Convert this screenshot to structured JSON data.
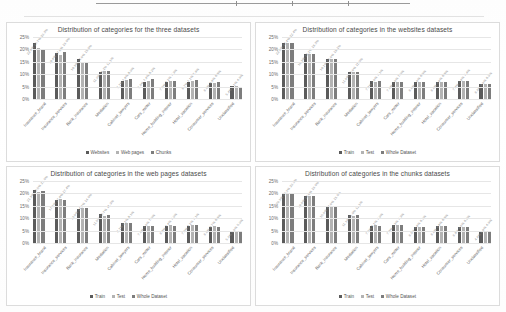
{
  "page": {
    "background_color": "#ffffff",
    "rule_color": "#9a9a9a"
  },
  "colors": {
    "series_1": "#5b5b5b",
    "series_2": "#b3b3b3",
    "series_3": "#7d7d7d",
    "gridline": "#e6e6e6",
    "title_text": "#4a4a4a",
    "tick_text": "#6b6b6b"
  },
  "categories": [
    "Insurance_brand",
    "Insurance_services",
    "Bank_insurance",
    "Mediation",
    "Cabinet_lawyers",
    "Cars_motor",
    "Home_building_interior",
    "Hotel_vacation",
    "Consumer_services",
    "Unclassified"
  ],
  "axis": {
    "y_ticks": [
      "0%",
      "5%",
      "10%",
      "15%",
      "20%",
      "25%"
    ],
    "y_min": 0,
    "y_max": 25
  },
  "charts": [
    {
      "id": "three-datasets",
      "title": "Distribution of categories for the three datasets",
      "legend": [
        "Websites",
        "Web pages",
        "Chunks"
      ]
    },
    {
      "id": "websites-datasets",
      "title": "Distribution of categories in the websites datasets",
      "legend": [
        "Train",
        "Test",
        "Whole Dataset"
      ]
    },
    {
      "id": "web-pages-datasets",
      "title": "Distribution of categories in the web pages datasets",
      "legend": [
        "Train",
        "Test",
        "Whole Dataset"
      ]
    },
    {
      "id": "chunks-datasets",
      "title": "Distribution of categories in the chunks datasets",
      "legend": [
        "Train",
        "Test",
        "Whole Dataset"
      ]
    }
  ],
  "chart_data": [
    {
      "type": "bar",
      "title": "Distribution of categories for the three datasets",
      "xlabel": "",
      "ylabel": "",
      "ylim": [
        0,
        25
      ],
      "grid": true,
      "legend_position": "bottom",
      "categories": [
        "Insurance_brand",
        "Insurance_services",
        "Bank_insurance",
        "Mediation",
        "Cabinet_lawyers",
        "Cars_motor",
        "Home_building_interior",
        "Hotel_vacation",
        "Consumer_services",
        "Unclassified"
      ],
      "series": [
        {
          "name": "Websites",
          "values": [
            22.4,
            18.4,
            16.3,
            11.0,
            7.1,
            7.0,
            7.0,
            6.7,
            6.6,
            5.4
          ]
        },
        {
          "name": "Web pages",
          "values": [
            20.7,
            17.8,
            14.9,
            11.1,
            7.6,
            7.4,
            7.2,
            7.1,
            6.6,
            5.1
          ]
        },
        {
          "name": "Chunks",
          "values": [
            20.3,
            19.0,
            15.0,
            11.1,
            8.0,
            8.2,
            7.3,
            7.6,
            6.8,
            4.9
          ]
        }
      ]
    },
    {
      "type": "bar",
      "title": "Distribution of categories in the websites datasets",
      "xlabel": "",
      "ylabel": "",
      "ylim": [
        0,
        25
      ],
      "grid": true,
      "legend_position": "bottom",
      "categories": [
        "Insurance_brand",
        "Insurance_services",
        "Bank_insurance",
        "Mediation",
        "Cabinet_lawyers",
        "Cars_motor",
        "Home_building_interior",
        "Hotel_vacation",
        "Consumer_services",
        "Unclassified"
      ],
      "series": [
        {
          "name": "Train",
          "values": [
            22.5,
            18.3,
            16.1,
            11.0,
            7.1,
            7.0,
            6.9,
            6.8,
            7.4,
            6.0
          ]
        },
        {
          "name": "Test",
          "values": [
            22.4,
            18.2,
            16.0,
            10.9,
            7.0,
            7.0,
            7.0,
            6.9,
            7.4,
            6.0
          ]
        },
        {
          "name": "Whole Dataset",
          "values": [
            22.4,
            18.3,
            16.1,
            11.0,
            7.1,
            7.0,
            6.9,
            6.8,
            7.4,
            6.0
          ]
        }
      ]
    },
    {
      "type": "bar",
      "title": "Distribution of categories in the web pages datasets",
      "xlabel": "",
      "ylabel": "",
      "ylim": [
        0,
        25
      ],
      "grid": true,
      "legend_position": "bottom",
      "categories": [
        "Insurance_brand",
        "Insurance_services",
        "Bank_insurance",
        "Mediation",
        "Cabinet_lawyers",
        "Cars_motor",
        "Home_building_interior",
        "Hotel_vacation",
        "Consumer_services",
        "Unclassified"
      ],
      "series": [
        {
          "name": "Train",
          "values": [
            21.3,
            17.2,
            13.9,
            11.5,
            8.1,
            7.0,
            6.8,
            7.0,
            6.6,
            5.0
          ]
        },
        {
          "name": "Test",
          "values": [
            20.5,
            17.6,
            14.2,
            10.7,
            8.1,
            7.0,
            7.4,
            7.2,
            6.7,
            5.0
          ]
        },
        {
          "name": "Whole Dataset",
          "values": [
            21.0,
            17.4,
            14.0,
            11.3,
            8.1,
            7.0,
            7.0,
            7.1,
            6.6,
            5.0
          ]
        }
      ]
    },
    {
      "type": "bar",
      "title": "Distribution of categories in the chunks datasets",
      "xlabel": "",
      "ylabel": "",
      "ylim": [
        0,
        25
      ],
      "grid": true,
      "legend_position": "bottom",
      "categories": [
        "Insurance_brand",
        "Insurance_services",
        "Bank_insurance",
        "Mediation",
        "Cabinet_lawyers",
        "Cars_motor",
        "Home_building_interior",
        "Hotel_vacation",
        "Consumer_services",
        "Unclassified"
      ],
      "series": [
        {
          "name": "Train",
          "values": [
            20.3,
            19.0,
            15.0,
            11.1,
            7.0,
            7.3,
            6.5,
            6.8,
            6.6,
            4.9
          ]
        },
        {
          "name": "Test",
          "values": [
            20.3,
            18.9,
            14.9,
            11.0,
            7.1,
            7.3,
            6.6,
            6.8,
            6.5,
            4.9
          ]
        },
        {
          "name": "Whole Dataset",
          "values": [
            20.3,
            19.0,
            15.0,
            11.1,
            7.0,
            7.3,
            6.5,
            6.8,
            6.6,
            4.9
          ]
        }
      ]
    }
  ]
}
